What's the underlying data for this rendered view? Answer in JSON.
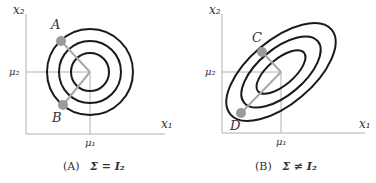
{
  "panels": [
    {
      "id": "A",
      "caption_tag": "(A)",
      "caption_expr": "Σ = I₂",
      "axes": {
        "x_label": "x₁",
        "y_label": "x₂",
        "mean_x_label": "μ₁",
        "mean_y_label": "μ₂"
      },
      "contour_shape": "concentric circles",
      "contour_count": 3,
      "points": [
        {
          "label": "A",
          "position": "upper-left on outer contour"
        },
        {
          "label": "B",
          "position": "lower-left on middle contour"
        }
      ]
    },
    {
      "id": "B",
      "caption_tag": "(B)",
      "caption_expr": "Σ ≠ I₂",
      "axes": {
        "x_label": "x₁",
        "y_label": "x₂",
        "mean_x_label": "μ₁",
        "mean_y_label": "μ₂"
      },
      "contour_shape": "concentric tilted ellipses",
      "contour_count": 3,
      "points": [
        {
          "label": "C",
          "position": "upper-left on middle contour"
        },
        {
          "label": "D",
          "position": "lower-left on outer contour"
        }
      ]
    }
  ],
  "colors": {
    "contour": "#1a1a1a",
    "axis": "#b0b0b0",
    "point": "#9a9a9a",
    "text": "#333333"
  }
}
